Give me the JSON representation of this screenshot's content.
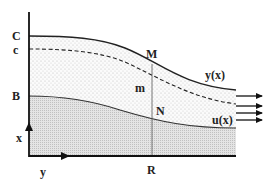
{
  "diagram": {
    "type": "flow-profile-schematic",
    "labels": {
      "C": "C",
      "c": "c",
      "B": "B",
      "x_axis": "x",
      "y_axis": "y",
      "M": "M",
      "m": "m",
      "N": "N",
      "R": "R",
      "y_of_x": "y(x)",
      "u_of_x": "u(x)"
    },
    "curves": [
      {
        "name": "outer-boundary",
        "style": "solid",
        "label": "y(x)"
      },
      {
        "name": "inner-dashed",
        "style": "dashed",
        "label": "c"
      },
      {
        "name": "core-boundary",
        "style": "solid",
        "label": "u(x)"
      }
    ],
    "regions": [
      {
        "name": "outer-layer",
        "fill": "light-dotted"
      },
      {
        "name": "core-layer",
        "fill": "dense-dotted"
      }
    ],
    "outflow_arrows": 4,
    "colors": {
      "line": "#222222",
      "light_fill": "#f3f3f3",
      "dense_fill": "#dedede",
      "background": "#ffffff"
    }
  }
}
